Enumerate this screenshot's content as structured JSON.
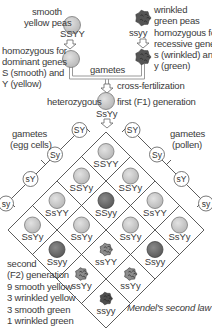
{
  "parents": {
    "smooth": {
      "label": "smooth\nyellow peas",
      "label_line1": "smooth",
      "label_line2": "yellow peas",
      "genotype": "SSYY",
      "desc_line1": "homozygous for",
      "desc_line2": "dominant genes",
      "desc_line3": "S (smooth) and",
      "desc_line4": "Y (yellow)"
    },
    "wrinkled": {
      "label_line1": "wrinkled",
      "label_line2": "green peas",
      "genotype": "ssyy",
      "desc_line1": "homozygous for",
      "desc_line2": "recessive genes",
      "desc_line3": "s (wrinkled) and",
      "desc_line4": "y (green)"
    }
  },
  "gametes_label": "gametes",
  "cross_label": "cross-fertilization",
  "f1": {
    "left_label": "heterozygous",
    "right_label": "first (F1) generation",
    "genotype": "SsYy"
  },
  "egg_gametes": {
    "label_line1": "gametes",
    "label_line2": "(egg cells)",
    "items": [
      "SY",
      "Sy",
      "sY",
      "sy"
    ]
  },
  "pollen_gametes": {
    "label_line1": "gametes",
    "label_line2": "(pollen)",
    "items": [
      "SY",
      "Sy",
      "sY",
      "sy"
    ]
  },
  "grid": {
    "cells": [
      {
        "row": 0,
        "col": 0,
        "genotype": "SSYY",
        "phenotype": "smooth-yellow"
      },
      {
        "row": 0,
        "col": 1,
        "genotype": "SSYy",
        "phenotype": "smooth-yellow"
      },
      {
        "row": 0,
        "col": 2,
        "genotype": "SsYY",
        "phenotype": "smooth-yellow"
      },
      {
        "row": 0,
        "col": 3,
        "genotype": "SsYy",
        "phenotype": "smooth-yellow"
      },
      {
        "row": 1,
        "col": 0,
        "genotype": "SSYy",
        "phenotype": "smooth-yellow"
      },
      {
        "row": 1,
        "col": 1,
        "genotype": "SSyy",
        "phenotype": "smooth-green"
      },
      {
        "row": 1,
        "col": 2,
        "genotype": "SsYy",
        "phenotype": "smooth-yellow"
      },
      {
        "row": 1,
        "col": 3,
        "genotype": "Ssyy",
        "phenotype": "smooth-green"
      },
      {
        "row": 2,
        "col": 0,
        "genotype": "SsYY",
        "phenotype": "smooth-yellow"
      },
      {
        "row": 2,
        "col": 1,
        "genotype": "SsYy",
        "phenotype": "smooth-yellow"
      },
      {
        "row": 2,
        "col": 2,
        "genotype": "ssYY",
        "phenotype": "wrinkled-yellow"
      },
      {
        "row": 2,
        "col": 3,
        "genotype": "ssYy",
        "phenotype": "wrinkled-yellow"
      },
      {
        "row": 3,
        "col": 0,
        "genotype": "SsYy",
        "phenotype": "smooth-yellow"
      },
      {
        "row": 3,
        "col": 1,
        "genotype": "Ssyy",
        "phenotype": "smooth-green"
      },
      {
        "row": 3,
        "col": 2,
        "genotype": "ssYy",
        "phenotype": "wrinkled-yellow"
      },
      {
        "row": 3,
        "col": 3,
        "genotype": "ssyy",
        "phenotype": "wrinkled-green"
      }
    ]
  },
  "f2": {
    "line1": "second",
    "line2": "(F2) generation",
    "results": [
      "9 smooth yellow",
      "3 wrinkled yellow",
      "3 smooth green",
      "1 wrinkled green"
    ]
  },
  "caption": "Mendel's second law",
  "colors": {
    "line": "#4a4a4a",
    "pea_light_fill": "#c9c9c9",
    "pea_light_stroke": "#7a7a7a",
    "pea_dark_fill": "#6e6e6e",
    "pea_wrinkled": "#555555",
    "connector": "#bdbdbd"
  }
}
